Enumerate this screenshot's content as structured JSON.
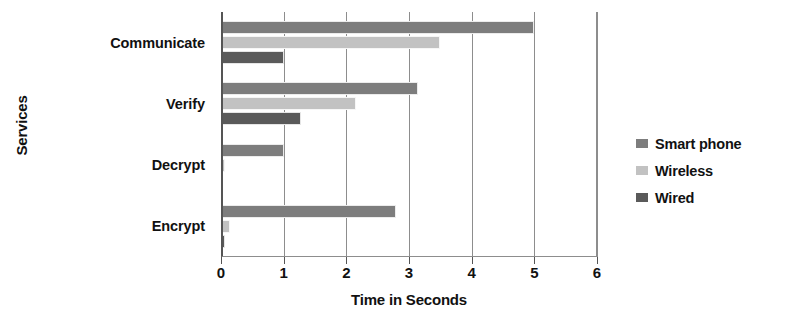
{
  "chart_data": {
    "type": "bar",
    "orientation": "horizontal",
    "title": "",
    "xlabel": "Time in Seconds",
    "ylabel": "Services",
    "categories": [
      "Communicate",
      "Verify",
      "Decrypt",
      "Encrypt"
    ],
    "series": [
      {
        "name": "Smart phone",
        "color": "#7d7d7d",
        "values": [
          5.0,
          3.15,
          1.0,
          2.8
        ]
      },
      {
        "name": "Wireless",
        "color": "#c2c2c2",
        "values": [
          3.5,
          2.15,
          0.06,
          0.14
        ]
      },
      {
        "name": "Wired",
        "color": "#5a5a5a",
        "values": [
          1.0,
          1.27,
          0.03,
          0.07
        ]
      }
    ],
    "xlim": [
      0,
      6
    ],
    "xticks": [
      0,
      1,
      2,
      3,
      4,
      5,
      6
    ],
    "xtick_labels": [
      "0",
      "1",
      "2",
      "3",
      "4",
      "5",
      "6"
    ],
    "grid": true,
    "grid_axis": "x",
    "legend_position": "right"
  },
  "axes": {
    "x_title": "Time in Seconds",
    "y_title": "Services"
  },
  "legend": {
    "items": [
      {
        "label": "Smart phone",
        "swatch": "smart-phone-swatch"
      },
      {
        "label": "Wireless",
        "swatch": "wireless-swatch"
      },
      {
        "label": "Wired",
        "swatch": "wired-swatch"
      }
    ]
  }
}
